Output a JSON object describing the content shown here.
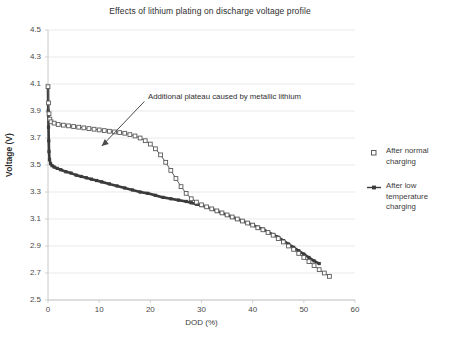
{
  "chart_data": {
    "type": "line",
    "title": "Effects of lithium plating on discharge voltage profile",
    "xlabel": "DOD (%)",
    "ylabel": "Voltage (V)",
    "xlim": [
      0,
      60
    ],
    "ylim": [
      2.5,
      4.5
    ],
    "xticks": [
      0,
      10,
      20,
      30,
      40,
      50,
      60
    ],
    "yticks": [
      2.5,
      2.7,
      2.9,
      3.1,
      3.3,
      3.5,
      3.7,
      3.9,
      4.1,
      4.3,
      4.5
    ],
    "grid": "horizontal",
    "legend_position": "right",
    "annotations": [
      {
        "text": "Additional plateau caused by metallic lithium",
        "x": 20,
        "y": 4.0,
        "arrow_to_x": 10.5,
        "arrow_to_y": 3.64
      }
    ],
    "series": [
      {
        "name": "After normal charging",
        "marker": "open-square",
        "color": "#5a5a5a",
        "points": [
          [
            0.0,
            4.08
          ],
          [
            0.1,
            3.96
          ],
          [
            0.2,
            3.88
          ],
          [
            0.35,
            3.84
          ],
          [
            0.6,
            3.82
          ],
          [
            1.2,
            3.81
          ],
          [
            2.0,
            3.8
          ],
          [
            3.0,
            3.795
          ],
          [
            4.0,
            3.79
          ],
          [
            5.0,
            3.785
          ],
          [
            6.0,
            3.78
          ],
          [
            7.0,
            3.775
          ],
          [
            8.0,
            3.77
          ],
          [
            9.0,
            3.765
          ],
          [
            10.0,
            3.76
          ],
          [
            11.0,
            3.755
          ],
          [
            12.0,
            3.75
          ],
          [
            13.0,
            3.745
          ],
          [
            14.0,
            3.74
          ],
          [
            15.0,
            3.735
          ],
          [
            16.0,
            3.725
          ],
          [
            17.0,
            3.715
          ],
          [
            18.0,
            3.7
          ],
          [
            19.0,
            3.68
          ],
          [
            20.0,
            3.655
          ],
          [
            21.0,
            3.62
          ],
          [
            22.0,
            3.575
          ],
          [
            23.0,
            3.52
          ],
          [
            24.0,
            3.46
          ],
          [
            25.0,
            3.4
          ],
          [
            26.0,
            3.34
          ],
          [
            27.0,
            3.29
          ],
          [
            28.0,
            3.25
          ],
          [
            29.0,
            3.225
          ],
          [
            30.0,
            3.205
          ],
          [
            31.0,
            3.19
          ],
          [
            32.0,
            3.175
          ],
          [
            33.0,
            3.16
          ],
          [
            34.0,
            3.145
          ],
          [
            35.0,
            3.13
          ],
          [
            36.0,
            3.115
          ],
          [
            37.0,
            3.1
          ],
          [
            38.0,
            3.085
          ],
          [
            39.0,
            3.07
          ],
          [
            40.0,
            3.055
          ],
          [
            41.0,
            3.035
          ],
          [
            42.0,
            3.02
          ],
          [
            43.0,
            3.0
          ],
          [
            44.0,
            2.98
          ],
          [
            45.0,
            2.955
          ],
          [
            46.0,
            2.93
          ],
          [
            47.0,
            2.9
          ],
          [
            48.0,
            2.875
          ],
          [
            49.0,
            2.845
          ],
          [
            50.0,
            2.815
          ],
          [
            51.0,
            2.785
          ],
          [
            52.0,
            2.755
          ],
          [
            53.0,
            2.725
          ],
          [
            54.0,
            2.7
          ],
          [
            55.0,
            2.675
          ]
        ]
      },
      {
        "name": "After low temperature charging",
        "marker": "plus-line",
        "color": "#3b3b3b",
        "points": [
          [
            0.0,
            4.08
          ],
          [
            0.05,
            3.9
          ],
          [
            0.1,
            3.78
          ],
          [
            0.15,
            3.68
          ],
          [
            0.2,
            3.6
          ],
          [
            0.3,
            3.54
          ],
          [
            0.5,
            3.51
          ],
          [
            0.8,
            3.495
          ],
          [
            1.2,
            3.485
          ],
          [
            1.8,
            3.475
          ],
          [
            2.5,
            3.465
          ],
          [
            3.5,
            3.45
          ],
          [
            4.5,
            3.44
          ],
          [
            5.5,
            3.425
          ],
          [
            6.5,
            3.415
          ],
          [
            7.5,
            3.405
          ],
          [
            8.5,
            3.395
          ],
          [
            9.5,
            3.385
          ],
          [
            10.5,
            3.375
          ],
          [
            12.0,
            3.36
          ],
          [
            13.5,
            3.345
          ],
          [
            15.0,
            3.33
          ],
          [
            16.5,
            3.315
          ],
          [
            18.0,
            3.3
          ],
          [
            19.5,
            3.29
          ],
          [
            21.0,
            3.275
          ],
          [
            22.5,
            3.26
          ],
          [
            24.0,
            3.25
          ],
          [
            25.5,
            3.24
          ],
          [
            27.0,
            3.23
          ],
          [
            28.0,
            3.22
          ],
          [
            29.0,
            3.21
          ],
          [
            30.0,
            3.2
          ],
          [
            31.0,
            3.19
          ],
          [
            32.0,
            3.175
          ],
          [
            33.0,
            3.16
          ],
          [
            34.0,
            3.145
          ],
          [
            35.0,
            3.13
          ],
          [
            36.0,
            3.115
          ],
          [
            37.0,
            3.1
          ],
          [
            38.0,
            3.085
          ],
          [
            39.0,
            3.07
          ],
          [
            40.0,
            3.055
          ],
          [
            41.0,
            3.04
          ],
          [
            42.0,
            3.025
          ],
          [
            43.0,
            3.005
          ],
          [
            44.0,
            2.985
          ],
          [
            45.0,
            2.965
          ],
          [
            46.0,
            2.94
          ],
          [
            47.0,
            2.915
          ],
          [
            48.0,
            2.89
          ],
          [
            49.0,
            2.865
          ],
          [
            50.0,
            2.84
          ],
          [
            51.0,
            2.815
          ],
          [
            52.0,
            2.79
          ],
          [
            53.0,
            2.77
          ]
        ]
      }
    ]
  },
  "plot": {
    "frame_color": "#c8c8c8",
    "grid_color": "#e3e3e3",
    "background": "#ffffff"
  }
}
